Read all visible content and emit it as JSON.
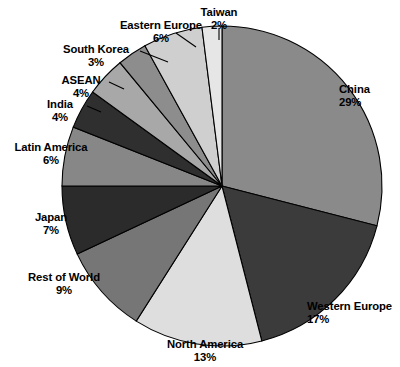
{
  "chart_data": {
    "type": "pie",
    "title": "",
    "subtitle": "",
    "xlabel": "",
    "ylabel": "",
    "legend_position": "none",
    "grid": false,
    "start_angle_deg": 0,
    "direction": "clockwise",
    "units": "percent",
    "categories": [
      "China",
      "Western Europe",
      "North America",
      "Rest of World",
      "Japan",
      "Latin America",
      "India",
      "ASEAN",
      "South Korea",
      "Eastern Europe",
      "Taiwan"
    ],
    "values": [
      29,
      17,
      13,
      9,
      7,
      6,
      4,
      4,
      3,
      6,
      2
    ],
    "labels": [
      "29%",
      "17%",
      "13%",
      "9%",
      "7%",
      "6%",
      "4%",
      "4%",
      "3%",
      "6%",
      "2%"
    ],
    "colors": [
      "#8a8a8a",
      "#3b3b3b",
      "#dedede",
      "#767676",
      "#2b2b2b",
      "#878787",
      "#2f2f2f",
      "#a8a8a8",
      "#8d8d8d",
      "#cfcfcf",
      "#e6e6e6"
    ],
    "slices": [
      {
        "name": "China",
        "value": 29,
        "label": "29%",
        "color": "#8a8a8a"
      },
      {
        "name": "Western Europe",
        "value": 17,
        "label": "17%",
        "color": "#3b3b3b"
      },
      {
        "name": "North America",
        "value": 13,
        "label": "13%",
        "color": "#dedede"
      },
      {
        "name": "Rest of World",
        "value": 9,
        "label": "9%",
        "color": "#767676"
      },
      {
        "name": "Japan",
        "value": 7,
        "label": "7%",
        "color": "#2b2b2b"
      },
      {
        "name": "Latin America",
        "value": 6,
        "label": "6%",
        "color": "#878787"
      },
      {
        "name": "India",
        "value": 4,
        "label": "4%",
        "color": "#2f2f2f"
      },
      {
        "name": "ASEAN",
        "value": 4,
        "label": "4%",
        "color": "#a8a8a8"
      },
      {
        "name": "South Korea",
        "value": 3,
        "label": "3%",
        "color": "#8d8d8d"
      },
      {
        "name": "Eastern Europe",
        "value": 6,
        "label": "6%",
        "color": "#cfcfcf"
      },
      {
        "name": "Taiwan",
        "value": 2,
        "label": "2%",
        "color": "#e6e6e6"
      }
    ]
  },
  "labels": {
    "china": {
      "name": "China",
      "pct": "29%"
    },
    "western_europe": {
      "name": "Western Europe",
      "pct": "17%"
    },
    "north_america": {
      "name": "North America",
      "pct": "13%"
    },
    "rest_of_world": {
      "name": "Rest of World",
      "pct": "9%"
    },
    "japan": {
      "name": "Japan",
      "pct": "7%"
    },
    "latin_america": {
      "name": "Latin America",
      "pct": "6%"
    },
    "india": {
      "name": "India",
      "pct": "4%"
    },
    "asean": {
      "name": "ASEAN",
      "pct": "4%"
    },
    "south_korea": {
      "name": "South Korea",
      "pct": "3%"
    },
    "eastern_europe": {
      "name": "Eastern Europe",
      "pct": "6%"
    },
    "taiwan": {
      "name": "Taiwan",
      "pct": "2%"
    }
  }
}
